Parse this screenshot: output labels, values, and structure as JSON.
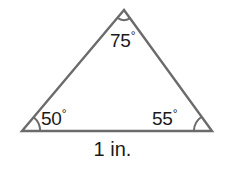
{
  "figure": {
    "background_color": "#ffffff",
    "stroke_color": "#6b6b6b",
    "text_color": "#1a1a1a",
    "degree_symbol": "°"
  },
  "triangle": {
    "vertices": {
      "apex": {
        "x": 124,
        "y": 10
      },
      "bottom_left": {
        "x": 22,
        "y": 131
      },
      "bottom_right": {
        "x": 212,
        "y": 131
      }
    },
    "path": "M124,10 L22,131 L212,131 Z"
  },
  "angles": {
    "apex": {
      "value": "75",
      "unit": "°",
      "label": "75°"
    },
    "bottom_left": {
      "value": "50",
      "unit": "°",
      "label": "50°"
    },
    "bottom_right": {
      "value": "55",
      "unit": "°",
      "label": "55°"
    }
  },
  "base": {
    "length_label": "1 in."
  }
}
